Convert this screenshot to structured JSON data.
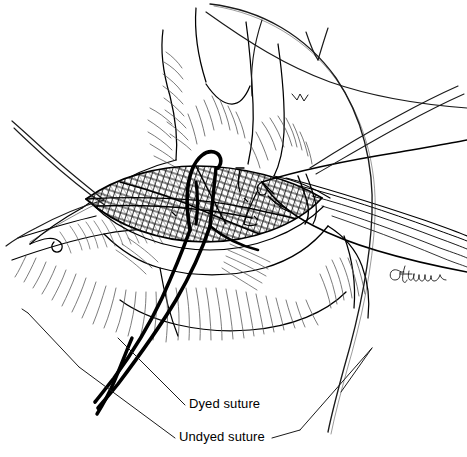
{
  "figure": {
    "domain": "medical-surgical-illustration",
    "background_color": "#ffffff",
    "ink_color": "#000000",
    "hatch_color": "#4a4a4a",
    "width": 467,
    "height": 457
  },
  "labels": [
    {
      "id": "dyed",
      "text": "Dyed suture",
      "x": 189,
      "y": 396,
      "leader_from": [
        185,
        405
      ],
      "leader_to": [
        118,
        338
      ]
    },
    {
      "id": "undyed",
      "text": "Undyed suture",
      "x": 179,
      "y": 429,
      "leader_from": [
        175,
        438
      ],
      "leader_to": [
        79,
        367
      ]
    }
  ],
  "leader_frame": {
    "left_vertex": [
      28,
      313
    ],
    "left_elbow": [
      79,
      367
    ],
    "right_vertex": [
      372,
      348
    ],
    "right_elbow": [
      300,
      430
    ],
    "color": "#1a1a1a",
    "stroke_width": 1
  },
  "signature": {
    "text": "GMueller",
    "x": 400,
    "y": 270
  },
  "elements": [
    {
      "name": "anatomical-tissue-body",
      "description": "Central soft tissue mass with hatched shading"
    },
    {
      "name": "incision-wound",
      "description": "Lens-shaped dark crosshatched open incision at center"
    },
    {
      "name": "surgical-instrument",
      "description": "Elongated clamp / forceps entering from right, tip at wound edge"
    },
    {
      "name": "dyed-suture-strand",
      "description": "Thick black suture passing through wound and trailing to lower left"
    },
    {
      "name": "undyed-suture-strand",
      "description": "Thin light suture arcing over top and down the right side"
    }
  ],
  "colors": {
    "ink": "#000000",
    "hatch": "#4d4d4d",
    "light_hatch": "#6e6e6e",
    "background": "#ffffff"
  }
}
